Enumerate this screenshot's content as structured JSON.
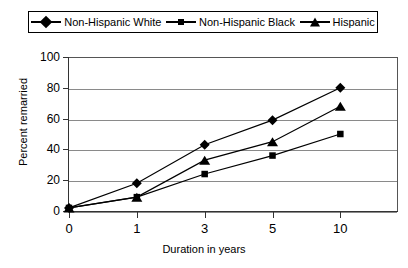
{
  "chart_data": {
    "type": "line",
    "title": "",
    "xlabel": "Duration in years",
    "ylabel": "Percent remarried",
    "categories": [
      "0",
      "1",
      "3",
      "5",
      "10"
    ],
    "ylim": [
      0,
      100
    ],
    "yticks": [
      "0",
      "20",
      "40",
      "60",
      "80",
      "100"
    ],
    "grid": true,
    "legend_position": "top",
    "series": [
      {
        "name": "Non-Hispanic White",
        "marker": "diamond",
        "values": [
          2,
          18,
          43,
          59,
          80
        ]
      },
      {
        "name": "Non-Hispanic Black",
        "marker": "square",
        "values": [
          2,
          9,
          24,
          36,
          50
        ]
      },
      {
        "name": "Hispanic",
        "marker": "triangle",
        "values": [
          2,
          9,
          33,
          45,
          68
        ]
      }
    ]
  },
  "colors": {
    "series": "#000000",
    "grid": "#8a8a8a",
    "axis": "#333333",
    "background": "#ffffff"
  }
}
